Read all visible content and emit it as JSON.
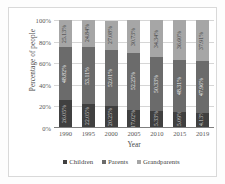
{
  "chart_data": {
    "type": "bar",
    "subtype": "stacked-100-percent",
    "title": "",
    "xlabel": "Year",
    "ylabel": "Percentage of people",
    "categories": [
      "1990",
      "1995",
      "2000",
      "2005",
      "2010",
      "2015",
      "2019"
    ],
    "ylim": [
      0,
      100
    ],
    "yticks": [
      "0%",
      "20%",
      "40%",
      "60%",
      "80%",
      "100%"
    ],
    "ytick_values": [
      0,
      20,
      40,
      60,
      80,
      100
    ],
    "grid": true,
    "legend_position": "bottom",
    "series": [
      {
        "name": "Children",
        "color": "#404040",
        "values": [
          26.05,
          22.05,
          20.25,
          17.02,
          15.33,
          15.09,
          14.13
        ],
        "labels": [
          "26.05%",
          "22.05%",
          "20.25%",
          "17.02%",
          "15.33%",
          "15.09%",
          "14.13%"
        ]
      },
      {
        "name": "Parents",
        "color": "#6b6b6b",
        "values": [
          48.82,
          53.11,
          52.01,
          52.25,
          50.33,
          48.31,
          47.96
        ],
        "labels": [
          "48.82%",
          "53.11%",
          "52.01%",
          "52.25%",
          "50.33%",
          "48.31%",
          "47.96%"
        ]
      },
      {
        "name": "Grandparents",
        "color": "#a6a6a6",
        "values": [
          25.13,
          24.84,
          27.08,
          30.73,
          34.34,
          36.6,
          37.91
        ],
        "labels": [
          "25.13%",
          "24.84%",
          "27.08%",
          "30.73%",
          "34.34%",
          "36.60%",
          "37.91%"
        ]
      }
    ]
  },
  "legend": {
    "items": [
      {
        "label": "Children",
        "color": "#404040"
      },
      {
        "label": "Parents",
        "color": "#6b6b6b"
      },
      {
        "label": "Grandparents",
        "color": "#a6a6a6"
      }
    ]
  }
}
